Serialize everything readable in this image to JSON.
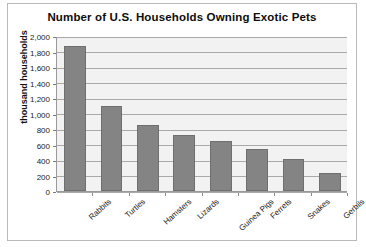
{
  "chart_data": {
    "type": "bar",
    "title": "Number of U.S. Households Owning Exotic Pets",
    "xlabel": "",
    "ylabel": "thousand households",
    "categories": [
      "Rabbits",
      "Turtles",
      "Hamsters",
      "Lizards",
      "Guinea Pigs",
      "Ferrets",
      "Snakes",
      "Gerbils"
    ],
    "values": [
      1870,
      1100,
      850,
      720,
      650,
      540,
      410,
      230
    ],
    "ylim": [
      0,
      2000
    ],
    "ytick_values": [
      0,
      200,
      400,
      600,
      800,
      1000,
      1200,
      1400,
      1600,
      1800,
      2000
    ],
    "ytick_labels": [
      "0",
      "200",
      "400",
      "600",
      "800",
      "1,000",
      "1,200",
      "1,400",
      "1,600",
      "1,800",
      "2,000"
    ],
    "grid": true,
    "legend": false,
    "bar_color": "#848484",
    "plot_background": "#f2f2f2"
  }
}
